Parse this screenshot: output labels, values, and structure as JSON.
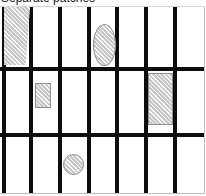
{
  "figure": {
    "title": "Separate patches",
    "type": "diagram",
    "canvas": {
      "width": 205,
      "height": 188
    },
    "colors": {
      "line": "#0d0d0d",
      "patch_fill": "#c9c9c9",
      "patch_stroke": "#8f8f8f",
      "background": "#ffffff",
      "frame": "#bfbfbf"
    },
    "grid": {
      "vertical_lines": [
        2,
        29,
        58,
        87,
        115,
        144,
        173
      ],
      "horizontal_lines": [
        60,
        126
      ],
      "line_thickness": 4,
      "columns": 7,
      "rows": 3
    },
    "patches": [
      {
        "name": "patch-trapezoid",
        "shape": "trapezoid",
        "row": 1,
        "column": 1,
        "x": 4,
        "y": 0,
        "width": 26,
        "height": 58
      },
      {
        "name": "patch-ellipse",
        "shape": "ellipse",
        "row": 1,
        "column": 4,
        "x": 93,
        "y": 17,
        "width": 23,
        "height": 42
      },
      {
        "name": "patch-small-rect",
        "shape": "rectangle",
        "row": 2,
        "column": 2,
        "x": 35,
        "y": 76,
        "width": 16,
        "height": 25
      },
      {
        "name": "patch-tall-rect",
        "shape": "rectangle",
        "row": 2,
        "column": 6,
        "x": 148,
        "y": 66,
        "width": 25,
        "height": 52
      },
      {
        "name": "patch-circle",
        "shape": "circle",
        "row": 3,
        "column": 3,
        "x": 63,
        "y": 147,
        "width": 21,
        "height": 21
      }
    ]
  }
}
